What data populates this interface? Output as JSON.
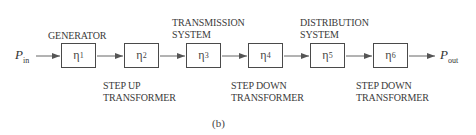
{
  "diagram": {
    "input": {
      "symbol": "P",
      "subscript": "in"
    },
    "output": {
      "symbol": "P",
      "subscript": "out"
    },
    "blocks": [
      {
        "symbol": "η",
        "subscript": "1",
        "label_above": [
          "GENERATOR"
        ],
        "label_below": []
      },
      {
        "symbol": "η",
        "subscript": "2",
        "label_above": [],
        "label_below": [
          "STEP UP",
          "TRANSFORMER"
        ]
      },
      {
        "symbol": "η",
        "subscript": "3",
        "label_above": [
          "TRANSMISSION",
          "SYSTEM"
        ],
        "label_below": []
      },
      {
        "symbol": "η",
        "subscript": "4",
        "label_above": [],
        "label_below": [
          "STEP DOWN",
          "TRANSFORMER"
        ]
      },
      {
        "symbol": "η",
        "subscript": "5",
        "label_above": [
          "DISTRIBUTION",
          "SYSTEM"
        ],
        "label_below": []
      },
      {
        "symbol": "η",
        "subscript": "6",
        "label_above": [],
        "label_below": [
          "STEP DOWN",
          "TRANSFORMER"
        ]
      }
    ],
    "caption": "(b)"
  }
}
